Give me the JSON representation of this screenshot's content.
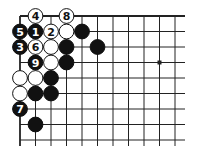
{
  "diagram": {
    "type": "go-board-corner",
    "grid": {
      "origin_x": 20,
      "origin_y": 16,
      "spacing": 15.5,
      "columns": 11,
      "rows": 9,
      "right_extend": 185,
      "bottom_extend": 146,
      "line_color": "#222222"
    },
    "star_points": [
      {
        "col": 9,
        "row": 3
      }
    ],
    "stones": [
      {
        "col": 1,
        "row": 0,
        "color": "white",
        "label": "4"
      },
      {
        "col": 3,
        "row": 0,
        "color": "white",
        "label": "8"
      },
      {
        "col": 0,
        "row": 1,
        "color": "black",
        "label": "5"
      },
      {
        "col": 1,
        "row": 1,
        "color": "black",
        "label": "1"
      },
      {
        "col": 2,
        "row": 1,
        "color": "white",
        "label": "2"
      },
      {
        "col": 3,
        "row": 1,
        "color": "white",
        "label": ""
      },
      {
        "col": 4,
        "row": 1,
        "color": "black",
        "label": ""
      },
      {
        "col": 0,
        "row": 2,
        "color": "black",
        "label": "3"
      },
      {
        "col": 1,
        "row": 2,
        "color": "white",
        "label": "6"
      },
      {
        "col": 2,
        "row": 2,
        "color": "white",
        "label": ""
      },
      {
        "col": 3,
        "row": 2,
        "color": "black",
        "label": ""
      },
      {
        "col": 5,
        "row": 2,
        "color": "black",
        "label": ""
      },
      {
        "col": 1,
        "row": 3,
        "color": "black",
        "label": "9"
      },
      {
        "col": 2,
        "row": 3,
        "color": "white",
        "label": ""
      },
      {
        "col": 3,
        "row": 3,
        "color": "black",
        "label": ""
      },
      {
        "col": 0,
        "row": 4,
        "color": "white",
        "label": ""
      },
      {
        "col": 1,
        "row": 4,
        "color": "white",
        "label": ""
      },
      {
        "col": 2,
        "row": 4,
        "color": "black",
        "label": ""
      },
      {
        "col": 0,
        "row": 5,
        "color": "white",
        "label": ""
      },
      {
        "col": 1,
        "row": 5,
        "color": "black",
        "label": ""
      },
      {
        "col": 2,
        "row": 5,
        "color": "black",
        "label": ""
      },
      {
        "col": 0,
        "row": 6,
        "color": "black",
        "label": "7"
      },
      {
        "col": 1,
        "row": 7,
        "color": "black",
        "label": ""
      }
    ],
    "colors": {
      "black_stone": "#111111",
      "white_stone": "#ffffff",
      "stone_outline": "#111111",
      "black_label": "#ffffff",
      "white_label": "#111111"
    }
  }
}
